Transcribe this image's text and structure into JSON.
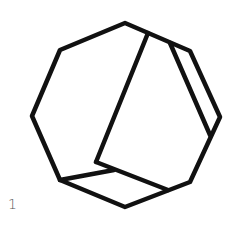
{
  "figure": {
    "label": "1",
    "stroke_color": "#111111",
    "stroke_width": 4.5,
    "outline": "125,23 190,51 220,117 190,182 125,207 60,180 32,116 60,50",
    "edges": [
      {
        "name": "diagonal-edge",
        "x1": 148,
        "y1": 33,
        "x2": 96,
        "y2": 162
      },
      {
        "name": "inner-bottom-edge",
        "x1": 96,
        "y1": 162,
        "x2": 168,
        "y2": 190
      },
      {
        "name": "lower-left-edge",
        "x1": 60,
        "y1": 180,
        "x2": 114,
        "y2": 170
      },
      {
        "name": "strip-inner-edge",
        "x1": 170,
        "y1": 43,
        "x2": 210,
        "y2": 135
      }
    ]
  }
}
